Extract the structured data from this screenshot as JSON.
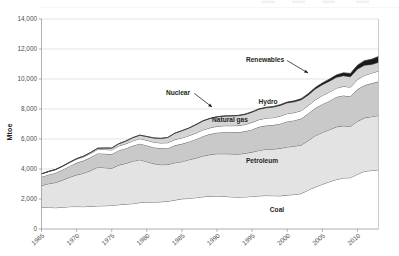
{
  "chart_data": {
    "type": "area",
    "stacked": true,
    "title": "",
    "xlabel": "",
    "ylabel": "Mtoe",
    "xlim": [
      1965,
      2013
    ],
    "ylim": [
      0,
      14000
    ],
    "ytick_step": 2000,
    "yticks": [
      0,
      2000,
      4000,
      6000,
      8000,
      10000,
      12000,
      14000
    ],
    "ytick_labels": [
      "0",
      "2,000",
      "4,000",
      "6,000",
      "8,000",
      "10,000",
      "12,000",
      "14,000"
    ],
    "xticks": [
      1965,
      1970,
      1975,
      1980,
      1985,
      1990,
      1995,
      2000,
      2005,
      2010
    ],
    "xtick_labels": [
      "1965",
      "1970",
      "1975",
      "1980",
      "1985",
      "1990",
      "1995",
      "2000",
      "2005",
      "2010"
    ],
    "grid": "horizontal",
    "legend_position": "annotations-inline",
    "x": [
      1965,
      1966,
      1967,
      1968,
      1969,
      1970,
      1971,
      1972,
      1973,
      1974,
      1975,
      1976,
      1977,
      1978,
      1979,
      1980,
      1981,
      1982,
      1983,
      1984,
      1985,
      1986,
      1987,
      1988,
      1989,
      1990,
      1991,
      1992,
      1993,
      1994,
      1995,
      1996,
      1997,
      1998,
      1999,
      2000,
      2001,
      2002,
      2003,
      2004,
      2005,
      2006,
      2007,
      2008,
      2009,
      2010,
      2011,
      2012,
      2013
    ],
    "series": [
      {
        "name": "Coal",
        "label": "Coal",
        "color": "#ffffff",
        "values": [
          1430,
          1440,
          1420,
          1450,
          1490,
          1500,
          1490,
          1510,
          1540,
          1550,
          1570,
          1620,
          1660,
          1690,
          1760,
          1790,
          1790,
          1810,
          1850,
          1930,
          2010,
          2040,
          2090,
          2150,
          2180,
          2200,
          2180,
          2140,
          2130,
          2140,
          2170,
          2210,
          2230,
          2220,
          2210,
          2260,
          2300,
          2360,
          2600,
          2800,
          2980,
          3150,
          3300,
          3400,
          3420,
          3650,
          3850,
          3900,
          3950
        ]
      },
      {
        "name": "Petroleum",
        "label": "Petroleum",
        "color": "#e3e3e3",
        "values": [
          1470,
          1580,
          1680,
          1810,
          1960,
          2110,
          2230,
          2390,
          2580,
          2540,
          2480,
          2640,
          2720,
          2830,
          2860,
          2700,
          2570,
          2480,
          2450,
          2490,
          2480,
          2580,
          2640,
          2720,
          2780,
          2820,
          2840,
          2870,
          2860,
          2910,
          2960,
          3030,
          3090,
          3110,
          3170,
          3210,
          3220,
          3240,
          3300,
          3420,
          3460,
          3470,
          3510,
          3480,
          3420,
          3530,
          3560,
          3590,
          3620
        ]
      },
      {
        "name": "Natural gas",
        "label": "Natural gas",
        "color": "#c9c9c9",
        "values": [
          570,
          600,
          640,
          690,
          740,
          800,
          840,
          880,
          920,
          930,
          930,
          980,
          990,
          1030,
          1070,
          1080,
          1080,
          1090,
          1090,
          1160,
          1190,
          1200,
          1260,
          1320,
          1370,
          1400,
          1430,
          1440,
          1460,
          1460,
          1510,
          1570,
          1580,
          1600,
          1640,
          1700,
          1720,
          1760,
          1800,
          1840,
          1880,
          1920,
          1990,
          2020,
          1990,
          2130,
          2170,
          2220,
          2260
        ]
      },
      {
        "name": "Hydro",
        "label": "Hydro",
        "color": "#ffffff",
        "values": [
          200,
          210,
          215,
          225,
          235,
          245,
          250,
          260,
          265,
          285,
          295,
          295,
          310,
          325,
          335,
          345,
          350,
          355,
          365,
          380,
          390,
          400,
          405,
          415,
          415,
          425,
          435,
          435,
          445,
          455,
          470,
          485,
          490,
          495,
          510,
          520,
          520,
          530,
          530,
          555,
          570,
          585,
          590,
          610,
          625,
          650,
          660,
          680,
          700
        ]
      },
      {
        "name": "Nuclear",
        "label": "Nuclear",
        "color": "#d4d4d4",
        "values": [
          5,
          8,
          12,
          18,
          25,
          35,
          50,
          65,
          80,
          95,
          120,
          150,
          180,
          215,
          230,
          250,
          280,
          305,
          350,
          430,
          480,
          510,
          560,
          600,
          620,
          630,
          640,
          650,
          660,
          670,
          680,
          690,
          690,
          700,
          710,
          720,
          720,
          725,
          710,
          720,
          730,
          730,
          720,
          710,
          700,
          700,
          680,
          580,
          580
        ]
      },
      {
        "name": "Renewables",
        "label": "Renewables",
        "color": "#1a1a1a",
        "values": [
          0,
          0,
          0,
          0,
          0,
          0,
          0,
          0,
          0,
          0,
          0,
          0,
          0,
          0,
          0,
          0,
          0,
          0,
          0,
          0,
          5,
          6,
          8,
          10,
          12,
          14,
          16,
          18,
          20,
          24,
          28,
          32,
          36,
          42,
          48,
          55,
          62,
          72,
          84,
          98,
          115,
          135,
          160,
          190,
          215,
          255,
          300,
          340,
          390
        ]
      }
    ],
    "annotations": [
      {
        "label": "Renewables",
        "text_x": 265,
        "text_y": 62,
        "arrow_to_x": 308,
        "arrow_to_y": 73
      },
      {
        "label": "Nuclear",
        "text_x": 178,
        "text_y": 95,
        "arrow_to_x": 212,
        "arrow_to_y": 107
      },
      {
        "label": "Hydro",
        "text_x": 268,
        "text_y": 104
      },
      {
        "label": "Natural gas",
        "text_x": 230,
        "text_y": 122
      },
      {
        "label": "Petroleum",
        "text_x": 262,
        "text_y": 163
      },
      {
        "label": "Coal",
        "text_x": 277,
        "text_y": 212
      }
    ],
    "ghost_top_marks": [
      "",
      "",
      "",
      ""
    ]
  }
}
